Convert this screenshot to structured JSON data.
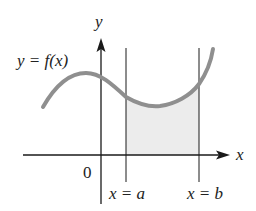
{
  "diagram": {
    "title": "",
    "labels": {
      "y_axis": "y",
      "x_axis": "x",
      "function": "y = f(x)",
      "origin": "0",
      "lower_bound": "x = a",
      "upper_bound": "x = b"
    },
    "colors": {
      "curve": "#8f8f8f",
      "shaded_region": "#ececec",
      "axes": "#1a1a1a",
      "text": "#222222"
    }
  }
}
